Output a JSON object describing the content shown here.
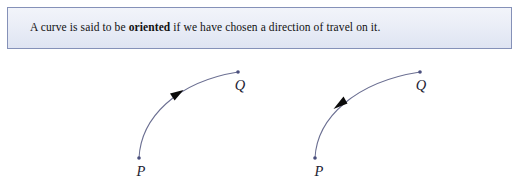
{
  "definition": {
    "text_before": "A curve is said to be ",
    "term": "oriented",
    "text_after": " if we have chosen a direction of travel on it.",
    "full_text": "A curve is said to be oriented if we have chosen a direction of travel on it.",
    "border_color": "#8591b8",
    "background_color": "#e8ecf6"
  },
  "figure": {
    "curve_color": "#6b6f92",
    "dot_color": "#4a4f7d",
    "arrow_color": "#0a0a0a",
    "diagrams": [
      {
        "name": "oriented-curve-p-to-q",
        "direction": "P to Q",
        "arrow_direction": "toward-Q",
        "start_label": "P",
        "end_label": "Q",
        "start_point": {
          "x": 139,
          "y": 106
        },
        "end_point": {
          "x": 238,
          "y": 20
        },
        "arrow_point": {
          "x": 176,
          "y": 43
        },
        "start_label_pos": {
          "x": 141,
          "y": 124
        },
        "end_label_pos": {
          "x": 238,
          "y": 38
        }
      },
      {
        "name": "oriented-curve-q-to-p",
        "direction": "Q to P",
        "arrow_direction": "toward-P",
        "start_label": "P",
        "end_label": "Q",
        "start_point": {
          "x": 315,
          "y": 106
        },
        "end_point": {
          "x": 420,
          "y": 20
        },
        "arrow_point": {
          "x": 340,
          "y": 50
        },
        "start_label_pos": {
          "x": 317,
          "y": 124
        },
        "end_label_pos": {
          "x": 418,
          "y": 38
        }
      }
    ]
  }
}
